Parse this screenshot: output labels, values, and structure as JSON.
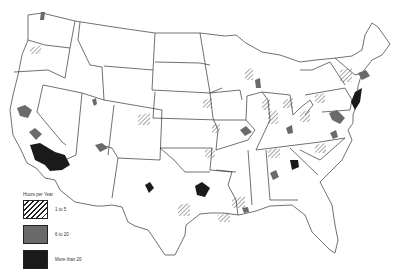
{
  "map": {
    "subject": "Contiguous United States",
    "legend": {
      "title": "Hours per Year",
      "items": [
        {
          "label": "1 to 5",
          "style": "hatched",
          "color": "#222222"
        },
        {
          "label": "6 to 20",
          "style": "solid",
          "color": "#6a6a6a"
        },
        {
          "label": "More than 20",
          "style": "solid",
          "color": "#1a1a1a"
        }
      ]
    },
    "colors": {
      "state_fill": "#ffffff",
      "state_border": "#333333",
      "medium": "#6a6a6a",
      "dark": "#1a1a1a"
    }
  }
}
